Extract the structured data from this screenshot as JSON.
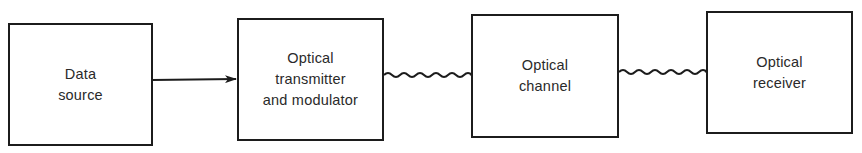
{
  "diagram": {
    "type": "block-diagram",
    "blocks": [
      {
        "id": "data-source",
        "label": "Data\nsource"
      },
      {
        "id": "optical-transmitter",
        "label": "Optical\ntransmitter\nand modulator"
      },
      {
        "id": "optical-channel",
        "label": "Optical\nchannel"
      },
      {
        "id": "optical-receiver",
        "label": "Optical\nreceiver"
      }
    ],
    "connections": [
      {
        "from": "data-source",
        "to": "optical-transmitter",
        "style": "straight-arrow"
      },
      {
        "from": "optical-transmitter",
        "to": "optical-channel",
        "style": "wavy-arrow"
      },
      {
        "from": "optical-channel",
        "to": "optical-receiver",
        "style": "wavy-arrow"
      }
    ],
    "colors": {
      "line": "#1c1c1c",
      "text": "#2a2a2a",
      "background": "#ffffff"
    }
  }
}
